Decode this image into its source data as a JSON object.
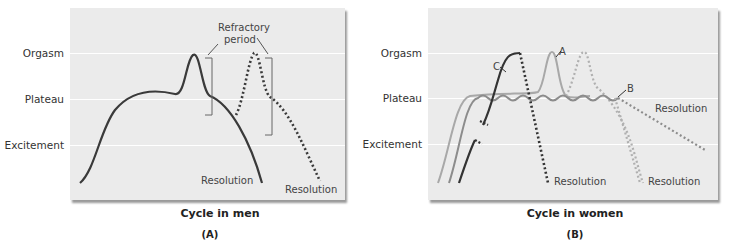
{
  "panel_a": {
    "caption": "Cycle in men",
    "sublabel": "(A)",
    "y_labels": [
      "Orgasm",
      "Plateau",
      "Excitement"
    ],
    "annotations": {
      "refractory_line1": "Refractory",
      "refractory_line2": "period",
      "resolution_1": "Resolution",
      "resolution_2": "Resolution"
    }
  },
  "panel_b": {
    "caption": "Cycle in women",
    "sublabel": "(B)",
    "y_labels": [
      "Orgasm",
      "Plateau",
      "Excitement"
    ],
    "annotations": {
      "label_a": "A",
      "label_b": "B",
      "label_c": "C",
      "resolution_1": "Resolution",
      "resolution_2": "Resolution",
      "resolution_3": "Resolution"
    }
  },
  "colors": {
    "panel_bg": "#ebebeb",
    "curve_dark": "#3a3a3a",
    "curve_a": "#a8a8a8",
    "curve_b": "#8c8c8c",
    "curve_c": "#333333"
  }
}
